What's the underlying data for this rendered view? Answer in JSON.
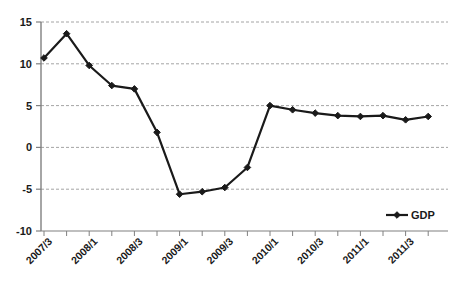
{
  "chart_data": {
    "type": "line",
    "title": "",
    "subtitle": "",
    "xlabel": "",
    "ylabel": "",
    "grid": true,
    "grid_axis": "y",
    "legend_position": "bottom-right",
    "ylim": [
      -10,
      15
    ],
    "ytick_labels": [
      "15",
      "10",
      "5",
      "0",
      "-5",
      "-10"
    ],
    "ytick_values": [
      15,
      10,
      5,
      0,
      -5,
      -10
    ],
    "xtick_labels": [
      "2007/3",
      "2008/1",
      "2008/3",
      "2009/1",
      "2009/3",
      "2010/1",
      "2010/3",
      "2011/1",
      "2011/3"
    ],
    "x": [
      "2007/3",
      "2007/4",
      "2008/1",
      "2008/2",
      "2008/3",
      "2008/4",
      "2009/1",
      "2009/2",
      "2009/3",
      "2009/4",
      "2010/1",
      "2010/2",
      "2010/3",
      "2010/4",
      "2011/1",
      "2011/2",
      "2011/3",
      "2011/4"
    ],
    "series": [
      {
        "name": "GDP",
        "color": "#1a1a1a",
        "marker": "diamond",
        "values": [
          10.7,
          13.6,
          9.8,
          7.4,
          7.0,
          1.8,
          -5.6,
          -5.3,
          -4.8,
          -2.4,
          5.0,
          4.5,
          4.1,
          3.8,
          3.7,
          3.8,
          3.3,
          3.7
        ]
      }
    ],
    "legend": [
      {
        "label": "GDP",
        "color": "#1a1a1a"
      }
    ]
  },
  "colors": {
    "line": "#1a1a1a",
    "axis": "#808080",
    "grid": "#9a9a9a",
    "background": "#ffffff",
    "text": "#1a1a1a"
  }
}
